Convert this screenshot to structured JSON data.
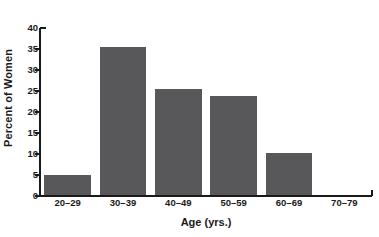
{
  "chart_data": {
    "type": "bar",
    "title": "",
    "xlabel": "Age (yrs.)",
    "ylabel": "Percent of Women",
    "categories": [
      "20–29",
      "30–39",
      "40–49",
      "50–59",
      "60–69",
      "70–79"
    ],
    "values": [
      5.0,
      35.5,
      25.4,
      23.7,
      10.2,
      0
    ],
    "ylim": [
      0,
      40
    ],
    "yticks": [
      0,
      5,
      10,
      15,
      20,
      25,
      30,
      35,
      40
    ],
    "ytick_labels": [
      "0",
      "5",
      "10",
      "15",
      "20",
      "25",
      "30",
      "35",
      "40"
    ],
    "grid": false,
    "legend": false,
    "legend_position": "none",
    "bar_color": "#58585a",
    "axis_color": "#1a1a1a",
    "background_color": "#ffffff"
  }
}
